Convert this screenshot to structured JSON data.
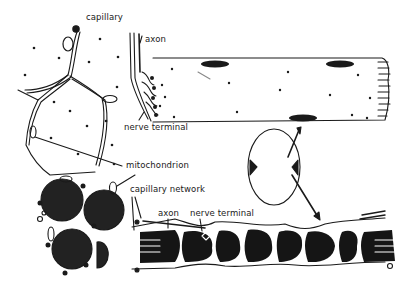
{
  "figure": {
    "labels": {
      "capillary": "capillary",
      "axon_top": "axon",
      "nerve_terminal_top": "nerve terminal",
      "mitochondrion": "mitochondrion",
      "capillary_network": "capillary network",
      "axon_bottom": "axon",
      "nerve_terminal_bottom": "nerve terminal"
    },
    "panels": [
      {
        "id": "cross-section-top-left",
        "content": "polygonal muscle fiber cross-sections bordered by capillaries, with scattered mitochondria"
      },
      {
        "id": "fiber-longitudinal",
        "content": "longitudinal single muscle fiber with nuclei, mitochondria and axon ending in nerve terminal"
      },
      {
        "id": "fiber-cross-oval",
        "content": "oval cross-section of fiber with arrows linking to longitudinal views"
      },
      {
        "id": "cross-section-bottom-left",
        "content": "dark round fiber cross-sections with capillaries"
      },
      {
        "id": "fiber-strip-bottom",
        "content": "longitudinal strip of dark fiber segments with capillary network, axon and nerve terminal"
      }
    ]
  }
}
